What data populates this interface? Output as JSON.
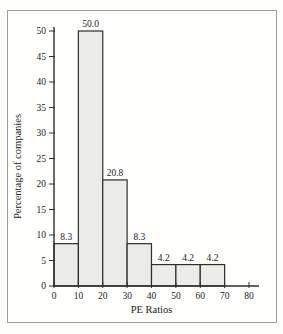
{
  "figure": {
    "frame_border_color": "#9e9f9e",
    "background_color": "#fffffe"
  },
  "chart_data": {
    "type": "bar",
    "subtype": "histogram",
    "title": "",
    "xlabel": "PE Ratios",
    "ylabel": "Percentage of companies",
    "xlim": [
      0,
      80
    ],
    "ylim": [
      0,
      50
    ],
    "grid": false,
    "legend": "none",
    "bins": [
      [
        0,
        10
      ],
      [
        10,
        20
      ],
      [
        20,
        30
      ],
      [
        30,
        40
      ],
      [
        40,
        50
      ],
      [
        50,
        60
      ],
      [
        60,
        70
      ]
    ],
    "categories": [
      "0-10",
      "10-20",
      "20-30",
      "30-40",
      "40-50",
      "50-60",
      "60-70"
    ],
    "values": [
      8.3,
      50.0,
      20.8,
      8.3,
      4.2,
      4.2,
      4.2
    ],
    "bar_value_labels": [
      "8.3",
      "50.0",
      "20.8",
      "8.3",
      "4.2",
      "4.2",
      "4.2"
    ],
    "x_ticks": [
      0,
      10,
      20,
      30,
      40,
      50,
      60,
      70,
      80
    ],
    "x_tick_labels": [
      "0",
      "10",
      "20",
      "30",
      "40",
      "50",
      "60",
      "70",
      "80"
    ],
    "y_ticks": [
      0,
      5,
      10,
      15,
      20,
      25,
      30,
      35,
      40,
      45,
      50
    ],
    "y_tick_labels": [
      "0",
      "5",
      "10",
      "15",
      "20",
      "25",
      "30",
      "35",
      "40",
      "45",
      "50"
    ],
    "bar_fill_color": "#ebebe8",
    "bar_stroke_color": "#2e2e2e",
    "axis_color": "#2e2e2e",
    "text_color": "#222222"
  }
}
